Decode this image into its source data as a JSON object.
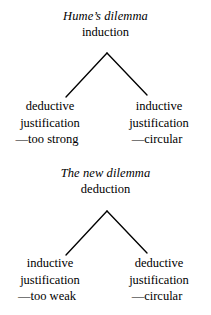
{
  "figure": {
    "background_color": "#ffffff",
    "text_color": "#000000",
    "diagrams": [
      {
        "title": "Hume’s dilemma",
        "subject": "induction",
        "left_branch": {
          "line1": "deductive",
          "line2": "justification",
          "verdict": "—too strong"
        },
        "right_branch": {
          "line1": "inductive",
          "line2": "justification",
          "verdict": "—circular"
        }
      },
      {
        "title": "The new dilemma",
        "subject": "deduction",
        "left_branch": {
          "line1": "inductive",
          "line2": "justification",
          "verdict": "—too weak"
        },
        "right_branch": {
          "line1": "deductive",
          "line2": "justification",
          "verdict": "—circular"
        }
      }
    ]
  }
}
